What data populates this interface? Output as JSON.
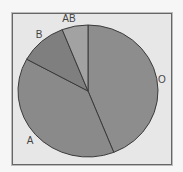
{
  "chart_data": {
    "type": "pie",
    "title": "",
    "categories": [
      "O",
      "A",
      "B",
      "AB"
    ],
    "values": [
      44,
      39,
      11,
      6
    ],
    "colors": [
      "#8d8d8d",
      "#8a8a8a",
      "#7f7f7f",
      "#a2a2a2"
    ],
    "start_angle_deg": 0,
    "direction": "clockwise",
    "legend": "none",
    "labels_outside": true
  },
  "labels": {
    "O": "O",
    "A": "A",
    "B": "B",
    "AB": "AB"
  }
}
